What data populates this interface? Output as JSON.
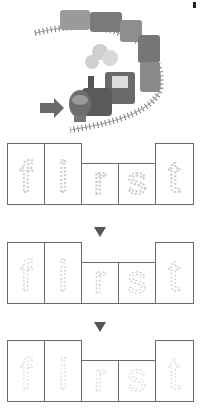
{
  "illustration": {
    "subject": "steam-train-on-curved-track",
    "pointer": "right-arrow"
  },
  "worksheet": {
    "word": "first",
    "letters": [
      "f",
      "i",
      "r",
      "s",
      "t"
    ],
    "rows": [
      {
        "style": "dotted-bold",
        "letters": [
          "f",
          "i",
          "r",
          "s",
          "t"
        ]
      },
      {
        "style": "dashed-thin",
        "letters": [
          "f",
          "i",
          "r",
          "s",
          "t"
        ]
      },
      {
        "style": "dashed-faint",
        "letters": [
          "f",
          "i",
          "r",
          "s",
          "t"
        ]
      }
    ],
    "step_indicator": "down-triangle"
  },
  "colors": {
    "border": "#6a6a6a",
    "letter_trace": "#c8c8c8",
    "arrow": "#555555",
    "train_body": "#5a5a5a"
  }
}
